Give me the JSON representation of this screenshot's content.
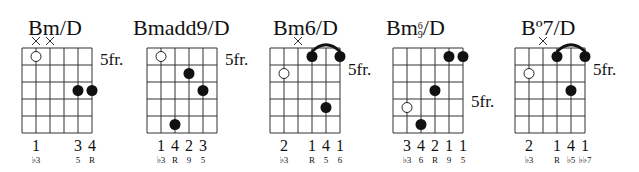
{
  "chords": [
    {
      "name": "Bm/D",
      "fret_label": "5fr.",
      "muted": [
        1,
        2
      ],
      "open": [
        {
          "s": 1,
          "f": 1
        }
      ],
      "dots": [
        {
          "s": 4,
          "f": 3
        },
        {
          "s": 5,
          "f": 3
        }
      ],
      "barre": null,
      "fingers": [
        {
          "s": 1,
          "t": "1"
        },
        {
          "s": 4,
          "t": "3"
        },
        {
          "s": 5,
          "t": "4"
        }
      ],
      "degrees": [
        {
          "s": 1,
          "t": "♭3"
        },
        {
          "s": 4,
          "t": "5"
        },
        {
          "s": 5,
          "t": "R"
        }
      ]
    },
    {
      "name": "Bmadd9/D",
      "fret_label": "5fr.",
      "muted": [],
      "open": [
        {
          "s": 1,
          "f": 1
        }
      ],
      "dots": [
        {
          "s": 3,
          "f": 2
        },
        {
          "s": 4,
          "f": 3
        },
        {
          "s": 2,
          "f": 5
        }
      ],
      "barre": null,
      "fingers": [
        {
          "s": 1,
          "t": "1"
        },
        {
          "s": 2,
          "t": "4"
        },
        {
          "s": 3,
          "t": "2"
        },
        {
          "s": 4,
          "t": "3"
        }
      ],
      "degrees": [
        {
          "s": 1,
          "t": "♭3"
        },
        {
          "s": 2,
          "t": "R"
        },
        {
          "s": 3,
          "t": "9"
        },
        {
          "s": 4,
          "t": "5"
        }
      ]
    },
    {
      "name": "Bm6/D",
      "fret_label": "5fr.",
      "muted": [
        2
      ],
      "open": [
        {
          "s": 1,
          "f": 2
        }
      ],
      "dots": [
        {
          "s": 3,
          "f": 1
        },
        {
          "s": 5,
          "f": 1
        },
        {
          "s": 4,
          "f": 4
        }
      ],
      "barre": {
        "from": 3,
        "to": 5
      },
      "fingers": [
        {
          "s": 1,
          "t": "2"
        },
        {
          "s": 3,
          "t": "1"
        },
        {
          "s": 4,
          "t": "4"
        },
        {
          "s": 5,
          "t": "1"
        }
      ],
      "degrees": [
        {
          "s": 1,
          "t": "♭3"
        },
        {
          "s": 3,
          "t": "R"
        },
        {
          "s": 4,
          "t": "5"
        },
        {
          "s": 5,
          "t": "6"
        }
      ]
    },
    {
      "name": "Bm",
      "name_sup_top": "6",
      "name_sup_bot": "9",
      "name_suffix": "/D",
      "fret_label": "5fr.",
      "muted": [],
      "open": [
        {
          "s": 1,
          "f": 4
        }
      ],
      "dots": [
        {
          "s": 4,
          "f": 1
        },
        {
          "s": 5,
          "f": 1
        },
        {
          "s": 3,
          "f": 3
        },
        {
          "s": 2,
          "f": 5
        }
      ],
      "barre": null,
      "fingers": [
        {
          "s": 1,
          "t": "3"
        },
        {
          "s": 2,
          "t": "4"
        },
        {
          "s": 3,
          "t": "2"
        },
        {
          "s": 4,
          "t": "1"
        },
        {
          "s": 5,
          "t": "1"
        }
      ],
      "degrees": [
        {
          "s": 1,
          "t": "♭3"
        },
        {
          "s": 2,
          "t": "6"
        },
        {
          "s": 3,
          "t": "R"
        },
        {
          "s": 4,
          "t": "9"
        },
        {
          "s": 5,
          "t": "5"
        }
      ]
    },
    {
      "name": "Bº7/D",
      "fret_label": "5fr.",
      "muted": [
        2
      ],
      "open": [
        {
          "s": 1,
          "f": 2
        }
      ],
      "dots": [
        {
          "s": 3,
          "f": 1
        },
        {
          "s": 5,
          "f": 1
        },
        {
          "s": 4,
          "f": 3
        }
      ],
      "barre": {
        "from": 3,
        "to": 5
      },
      "fingers": [
        {
          "s": 1,
          "t": "2"
        },
        {
          "s": 3,
          "t": "1"
        },
        {
          "s": 4,
          "t": "4"
        },
        {
          "s": 5,
          "t": "1"
        }
      ],
      "degrees": [
        {
          "s": 1,
          "t": "♭3"
        },
        {
          "s": 3,
          "t": "R"
        },
        {
          "s": 4,
          "t": "♭5"
        },
        {
          "s": 5,
          "t": "♭♭7"
        }
      ]
    }
  ],
  "layout": [
    {
      "left": 0,
      "gx": 22,
      "gy": 48,
      "frY": 58,
      "titleX": 28,
      "titleY": 17
    },
    {
      "left": 125,
      "gx": 22,
      "gy": 48,
      "frY": 58,
      "titleX": 8,
      "titleY": 17
    },
    {
      "left": 250,
      "gx": 20,
      "gy": 48,
      "frY": 68,
      "titleX": 23,
      "titleY": 17
    },
    {
      "left": 370,
      "gx": 23,
      "gy": 48,
      "frY": 100,
      "titleX": 16,
      "titleY": 17
    },
    {
      "left": 505,
      "gx": 10,
      "gy": 48,
      "frY": 68,
      "titleX": 16,
      "titleY": 17
    }
  ]
}
